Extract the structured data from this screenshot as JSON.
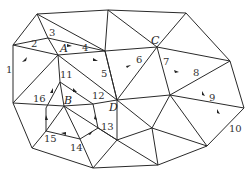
{
  "diagram": {
    "type": "triangulated-graph-path",
    "vertices": {
      "P1": [
        37,
        14
      ],
      "P2": [
        108,
        10
      ],
      "P3": [
        186,
        13
      ],
      "P4": [
        13,
        45
      ],
      "P5": [
        48,
        38
      ],
      "A": [
        58,
        55
      ],
      "P6": [
        105,
        51
      ],
      "C": [
        157,
        47
      ],
      "P7": [
        230,
        61
      ],
      "D": [
        117,
        100
      ],
      "P8": [
        170,
        95
      ],
      "P9": [
        244,
        108
      ],
      "P10": [
        60,
        82
      ],
      "P11": [
        93,
        104
      ],
      "B": [
        64,
        106
      ],
      "P12": [
        13,
        103
      ],
      "P13": [
        46,
        108
      ],
      "P14": [
        46,
        131
      ],
      "P15": [
        80,
        139
      ],
      "P16": [
        98,
        128
      ],
      "P17": [
        32,
        148
      ],
      "P18": [
        93,
        168
      ],
      "P19": [
        152,
        128
      ],
      "P20": [
        158,
        165
      ],
      "P21": [
        207,
        146
      ]
    },
    "vertex_labels": [
      {
        "text": "A",
        "x": 60,
        "y": 52
      },
      {
        "text": "C",
        "x": 151,
        "y": 44
      },
      {
        "text": "D",
        "x": 110,
        "y": 110
      },
      {
        "text": "B",
        "x": 66,
        "y": 104
      }
    ],
    "path_labels": [
      {
        "text": "1",
        "x": 6,
        "y": 72
      },
      {
        "text": "2",
        "x": 31,
        "y": 46
      },
      {
        "text": "3",
        "x": 48,
        "y": 35
      },
      {
        "text": "4",
        "x": 83,
        "y": 50
      },
      {
        "text": "5",
        "x": 102,
        "y": 76
      },
      {
        "text": "6",
        "x": 136,
        "y": 62
      },
      {
        "text": "7",
        "x": 163,
        "y": 64
      },
      {
        "text": "8",
        "x": 193,
        "y": 75
      },
      {
        "text": "9",
        "x": 209,
        "y": 100
      },
      {
        "text": "10",
        "x": 229,
        "y": 131
      },
      {
        "text": "11",
        "x": 60,
        "y": 77
      },
      {
        "text": "12",
        "x": 93,
        "y": 98
      },
      {
        "text": "13",
        "x": 101,
        "y": 129
      },
      {
        "text": "14",
        "x": 70,
        "y": 150
      },
      {
        "text": "15",
        "x": 44,
        "y": 141
      },
      {
        "text": "16",
        "x": 33,
        "y": 101
      }
    ]
  }
}
